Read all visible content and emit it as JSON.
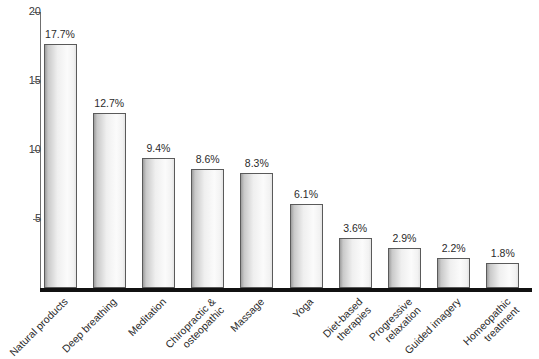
{
  "chart_data": {
    "type": "bar",
    "title": "",
    "subtitle": "",
    "xlabel": "",
    "ylabel": "",
    "ylim": [
      0,
      20
    ],
    "grid": false,
    "legend": null,
    "y_ticks": [
      {
        "value": 20,
        "label": "20"
      },
      {
        "value": 15,
        "label": "15"
      },
      {
        "value": 10,
        "label": "10"
      },
      {
        "value": 5,
        "label": "5"
      }
    ],
    "categories": [
      "Natural products",
      "Deep breathing",
      "Meditation",
      "Chiropractic & osteopathic",
      "Massage",
      "Yoga",
      "Diet-based therapies",
      "Progressive relaxation",
      "Guided imagery",
      "Homeopathic treatment"
    ],
    "category_lines": [
      [
        "Natural products"
      ],
      [
        "Deep breathing"
      ],
      [
        "Meditation"
      ],
      [
        "Chiropractic &",
        "osteopathic"
      ],
      [
        "Massage"
      ],
      [
        "Yoga"
      ],
      [
        "Diet-based",
        "therapies"
      ],
      [
        "Progressive",
        "relaxation"
      ],
      [
        "Guided imagery"
      ],
      [
        "Homeopathic",
        "treatment"
      ]
    ],
    "values": [
      17.7,
      12.7,
      9.4,
      8.6,
      8.3,
      6.1,
      3.6,
      2.9,
      2.2,
      1.8
    ],
    "value_labels": [
      "17.7%",
      "12.7%",
      "9.4%",
      "8.6%",
      "8.3%",
      "6.1%",
      "3.6%",
      "2.9%",
      "2.2%",
      "1.8%"
    ],
    "colors": {
      "bar_fill_light": "#fbfbfb",
      "bar_fill_dark": "#9d9d9d",
      "bar_border": "#5a5a5a",
      "axis": "#6f6f6f",
      "baseline": "#111111",
      "text": "#2b2b2b",
      "background": "#ffffff"
    }
  }
}
